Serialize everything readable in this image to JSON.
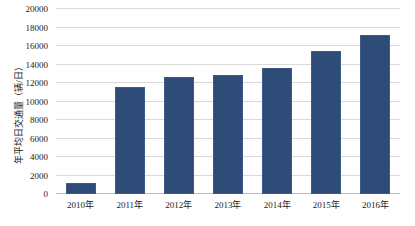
{
  "chart_data": {
    "type": "bar",
    "title": "",
    "subtitle": "",
    "xlabel": "",
    "ylabel": "年平均日交通量（辆/日）",
    "categories": [
      "2010年",
      "2011年",
      "2012年",
      "2013年",
      "2014年",
      "2015年",
      "2016年"
    ],
    "values": [
      1200,
      11600,
      12600,
      12900,
      13600,
      15500,
      17200
    ],
    "series": [
      {
        "name": "年平均日交通量",
        "values": [
          1200,
          11600,
          12600,
          12900,
          13600,
          15500,
          17200
        ]
      }
    ],
    "ylim": [
      0,
      20000
    ],
    "ytick_step": 2000,
    "ytick_labels": [
      "0",
      "2000",
      "4000",
      "6000",
      "8000",
      "10000",
      "12000",
      "14000",
      "16000",
      "18000",
      "20000"
    ],
    "ytick_values": [
      0,
      2000,
      4000,
      6000,
      8000,
      10000,
      12000,
      14000,
      16000,
      18000,
      20000
    ],
    "grid": true,
    "grid_axis": "y",
    "legend": false,
    "legend_position": "none",
    "bar_color": "#2e4c77",
    "bar_edge_color": "#3a5a8a",
    "grid_color": "#d9d9d9",
    "axis_color": "#bfbfbf",
    "background": "#ffffff",
    "text_color": "#1a1a1a"
  }
}
